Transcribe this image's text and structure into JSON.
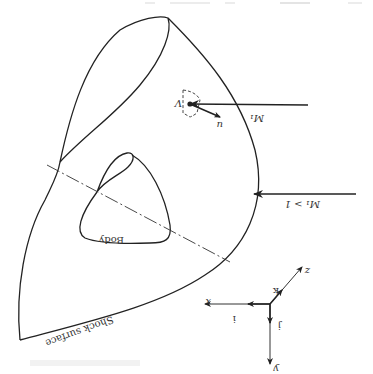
{
  "figure": {
    "orientation": "rotated-180",
    "labels": {
      "body": "Body",
      "shock_surface": "Shock surface",
      "freestream_mach": "M₁",
      "mach_condition": "M₁ > 1",
      "volume": "V",
      "velocity": "u",
      "axis_x": "x",
      "axis_y": "y",
      "axis_z": "z",
      "unit_i": "i",
      "unit_j": "j",
      "unit_k": "k"
    },
    "colors": {
      "ink": "#222222",
      "background": "#ffffff"
    }
  }
}
